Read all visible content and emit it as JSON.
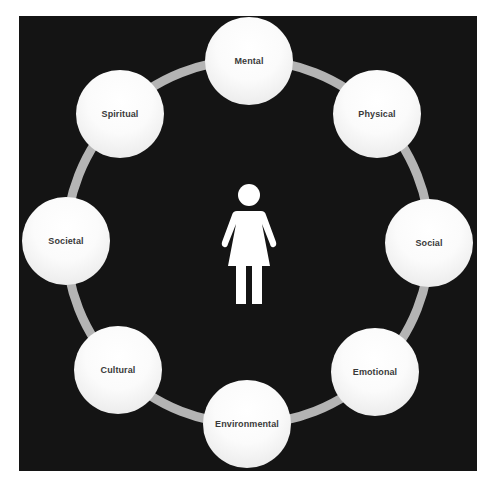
{
  "diagram": {
    "type": "circular-cycle",
    "center_icon": "female-person-icon",
    "colors": {
      "background": "#141414",
      "ring": "#b4b4b4",
      "node_fill": "#ffffff",
      "node_text": "#3a3a3a",
      "figure": "#ffffff"
    },
    "nodes": [
      {
        "label": "Mental"
      },
      {
        "label": "Physical"
      },
      {
        "label": "Social"
      },
      {
        "label": "Emotional"
      },
      {
        "label": "Environmental"
      },
      {
        "label": "Cultural"
      },
      {
        "label": "Societal"
      },
      {
        "label": "Spiritual"
      }
    ]
  }
}
